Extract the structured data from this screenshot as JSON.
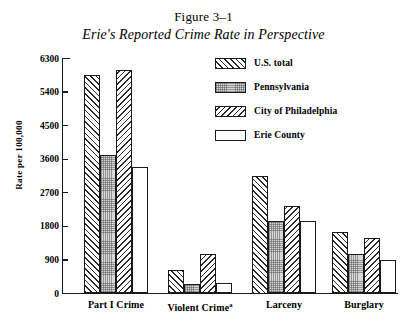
{
  "figure": {
    "number": "Figure 3–1",
    "title": "Erie's Reported Crime Rate in Perspective"
  },
  "chart_data": {
    "type": "bar",
    "title": "Erie's Reported Crime Rate in Perspective",
    "figure_number": "Figure 3–1",
    "xlabel": "",
    "ylabel": "Rate per 100,000",
    "ylim": [
      0,
      6300
    ],
    "yticks": [
      0,
      900,
      1800,
      2700,
      3600,
      4500,
      5400,
      6300
    ],
    "ytick_labels": [
      "0",
      "900",
      "1800",
      "2700",
      "3600",
      "4500",
      "5400",
      "6300"
    ],
    "grid": false,
    "legend_position": "upper right",
    "categories": [
      "Part I Crime",
      "Violent Crimeᵃ",
      "Larceny",
      "Burglary"
    ],
    "category_labels": [
      {
        "text": "Part I Crime",
        "note": ""
      },
      {
        "text": "Violent Crime",
        "note": "a"
      },
      {
        "text": "Larceny",
        "note": ""
      },
      {
        "text": "Burglary",
        "note": ""
      }
    ],
    "series": [
      {
        "name": "U.S. total",
        "pattern": "forward-hatch",
        "values": [
          5850,
          620,
          3150,
          1650
        ]
      },
      {
        "name": "Pennsylvania",
        "pattern": "stipple",
        "values": [
          3720,
          260,
          1950,
          1050
        ]
      },
      {
        "name": "City of Philadelphia",
        "pattern": "backward-hatch",
        "values": [
          5990,
          1060,
          2350,
          1500
        ]
      },
      {
        "name": "Erie County",
        "pattern": "open",
        "values": [
          3400,
          270,
          1950,
          900
        ]
      }
    ]
  },
  "legend": {
    "items": [
      {
        "label": "U.S. total",
        "pattern": "forward-hatch"
      },
      {
        "label": "Pennsylvania",
        "pattern": "stipple"
      },
      {
        "label": "City of Philadelphia",
        "pattern": "backward-hatch"
      },
      {
        "label": "Erie County",
        "pattern": "open"
      }
    ]
  },
  "colors": {
    "ink": "#1a1a1a",
    "background": "#ffffff",
    "stipple_fill": "#d8d8d8"
  }
}
